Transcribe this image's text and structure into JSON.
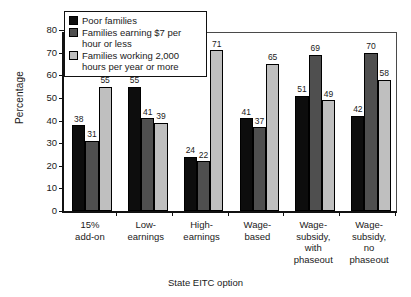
{
  "chart_data": {
    "type": "bar",
    "title": "",
    "xlabel": "State EITC option",
    "ylabel": "Percentage",
    "ylim": [
      0,
      80
    ],
    "yticks": [
      0,
      10,
      20,
      30,
      40,
      50,
      60,
      70,
      80
    ],
    "grid": false,
    "legend_position": "top-left-inside",
    "categories": [
      "15%\nadd-on",
      "Low-\nearnings",
      "High-\nearnings",
      "Wage-\nbased",
      "Wage-\nsubsidy,\nwith\nphaseout",
      "Wage-\nsubsidy,\nno\nphaseout"
    ],
    "series": [
      {
        "name": "Poor families",
        "color": "#0d0d0d",
        "values": [
          38,
          55,
          24,
          41,
          51,
          42
        ]
      },
      {
        "name": "Families earning $7 per hour or less",
        "color": "#4f4f4f",
        "values": [
          31,
          41,
          22,
          37,
          69,
          70
        ]
      },
      {
        "name": "Families working 2,000 hours per year or more",
        "color": "#bfbfbf",
        "values": [
          55,
          39,
          71,
          65,
          49,
          58
        ]
      }
    ]
  },
  "legend": {
    "items": [
      {
        "label": "Poor families",
        "swatch": "s0"
      },
      {
        "label": "Families earning $7 per hour or less",
        "swatch": "s1"
      },
      {
        "label": "Families working 2,000 hours per year or more",
        "swatch": "s2"
      }
    ]
  }
}
